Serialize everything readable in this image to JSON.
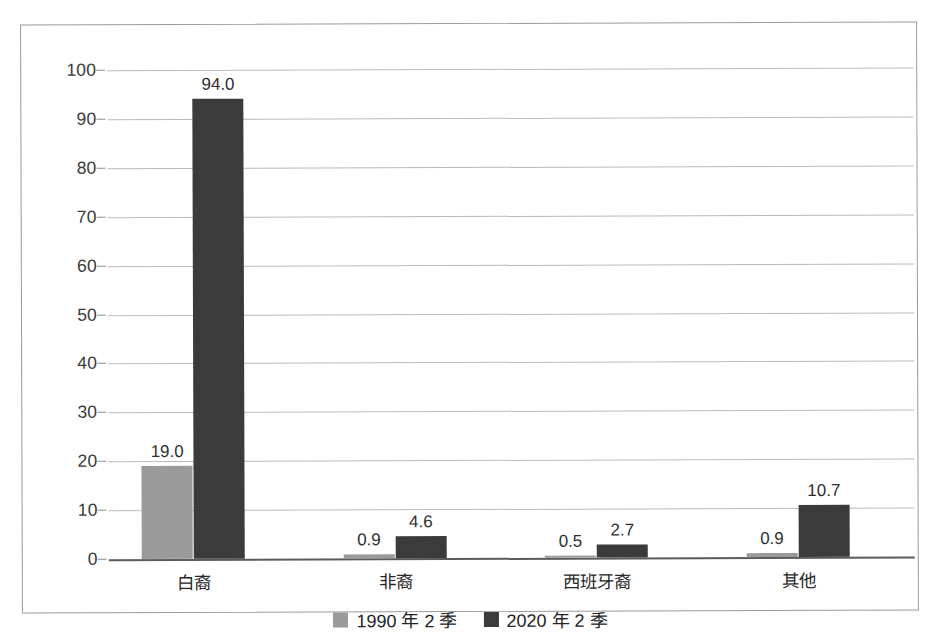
{
  "chart_data": {
    "type": "bar",
    "title": "",
    "xlabel": "",
    "ylabel": "",
    "ylim": [
      0,
      100
    ],
    "ytick_step": 10,
    "grid": true,
    "legend_position": "bottom",
    "categories": [
      "白裔",
      "非裔",
      "西班牙裔",
      "其他"
    ],
    "yticks": [
      "0",
      "10",
      "20",
      "30",
      "40",
      "50",
      "60",
      "70",
      "80",
      "90",
      "100"
    ],
    "series": [
      {
        "name": "1990 年 2 季",
        "color": "#9a9a9a",
        "values": [
          19.0,
          0.9,
          0.5,
          0.9
        ],
        "labels": [
          "19.0",
          "0.9",
          "0.5",
          "0.9"
        ]
      },
      {
        "name": "2020 年 2 季",
        "color": "#3b3b3b",
        "values": [
          94.0,
          4.6,
          2.7,
          10.7
        ],
        "labels": [
          "94.0",
          "4.6",
          "2.7",
          "10.7"
        ]
      }
    ]
  },
  "legend": {
    "items": [
      {
        "label": "1990 年 2 季",
        "color": "#9a9a9a"
      },
      {
        "label": "2020 年 2 季",
        "color": "#3b3b3b"
      }
    ]
  }
}
